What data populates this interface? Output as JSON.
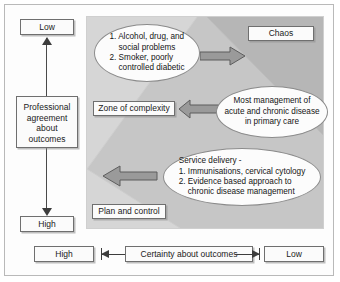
{
  "diagram": {
    "panel": {
      "bands": {
        "band_light": "#d3d3d3",
        "band_mid": "#c2c2c2",
        "band_dark": "#b4b4b4"
      }
    },
    "boxes": {
      "chaos": "Chaos",
      "zone_of_complexity": "Zone of complexity",
      "plan_and_control": "Plan and control"
    },
    "ellipses": {
      "top": {
        "items": [
          "1. Alcohol, drug, and",
          "social problems",
          "2. Smoker, poorly",
          "controlled diabetic"
        ]
      },
      "middle": {
        "lines": [
          "Most management of",
          "acute and chronic disease",
          "in primary care"
        ]
      },
      "bottom": {
        "heading": "Service delivery -",
        "items": [
          "1. Immunisations, cervical cytology",
          "2. Evidence based approach to",
          "chronic disease management"
        ]
      }
    },
    "y_axis": {
      "top_label": "Low",
      "title_lines": [
        "Professional",
        "agreement",
        "about",
        "outcomes"
      ],
      "bottom_label": "High"
    },
    "x_axis": {
      "left_label": "High",
      "title": "Certainty about outcomes",
      "right_label": "Low"
    },
    "arrows": {
      "top": "arrow-right-icon",
      "middle": "arrow-left-icon",
      "bottom": "arrow-left-icon",
      "y_axis": "arrow-up-down-icon",
      "x_axis": "arrow-left-right-icon"
    },
    "colors": {
      "arrow_fill": "#9a9a9a",
      "arrow_stroke": "#5d5d5d",
      "box_border": "#6f6f6f",
      "text": "#141414"
    }
  }
}
